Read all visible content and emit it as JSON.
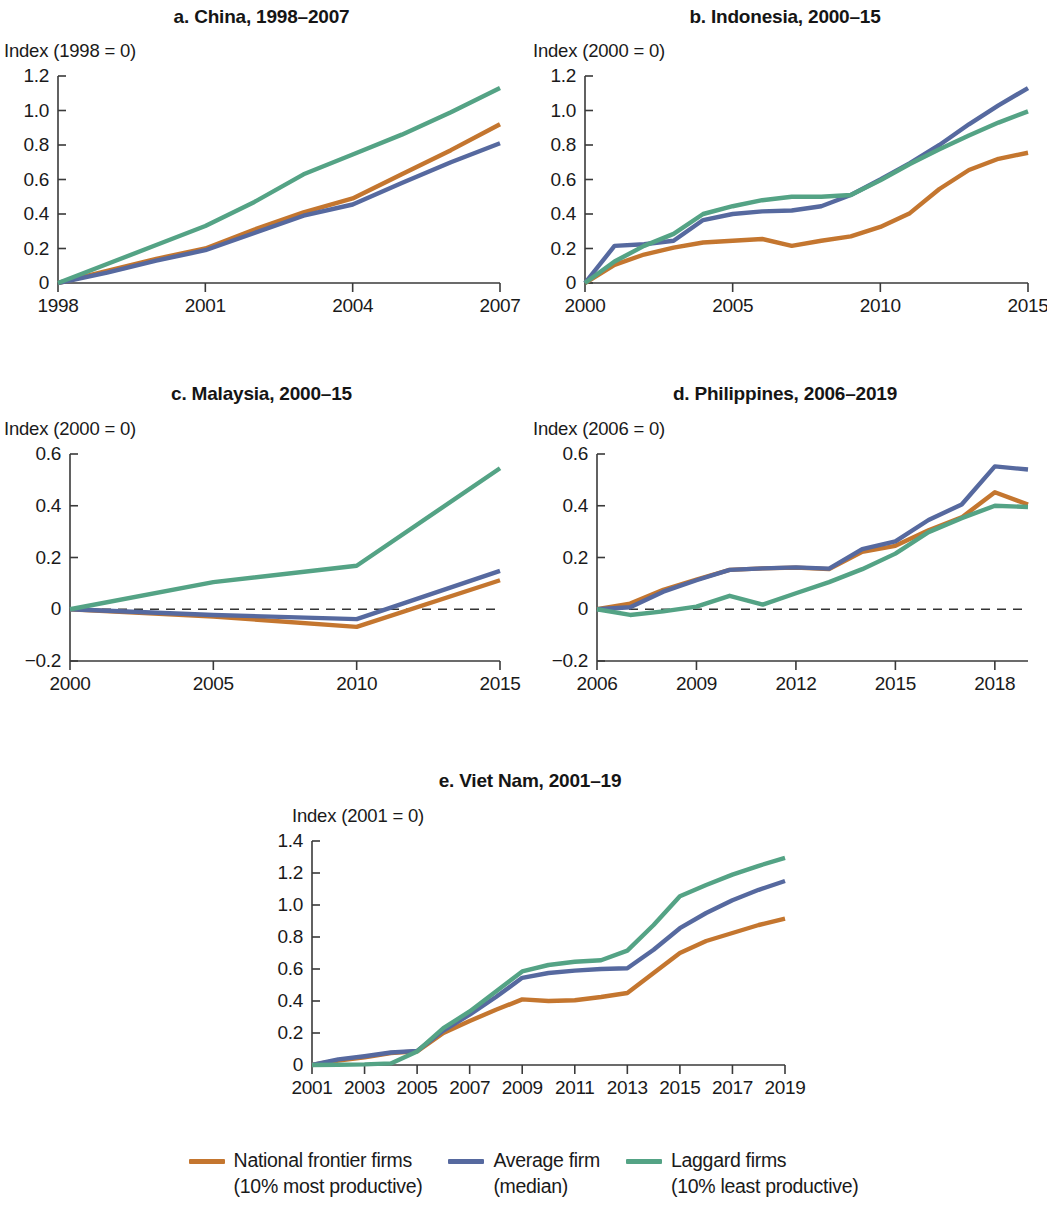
{
  "figure": {
    "background": "#ffffff",
    "colors": {
      "frontier": "#c4762f",
      "average": "#56699f",
      "laggard": "#54a385"
    }
  },
  "legend": {
    "items": [
      {
        "key": "frontier",
        "color": "#c4762f",
        "line1": "National frontier firms",
        "line2": "(10% most productive)"
      },
      {
        "key": "average",
        "color": "#56699f",
        "line1": "Average firm",
        "line2": "(median)"
      },
      {
        "key": "laggard",
        "color": "#54a385",
        "line1": "Laggard firms",
        "line2": "(10% least productive)"
      }
    ]
  },
  "chart_data": [
    {
      "id": "china",
      "type": "line",
      "title": "a. China, 1998–2007",
      "ylabel": "Index (1998 = 0)",
      "xlabel": "",
      "grid": false,
      "zeroline": false,
      "legend_position": "bottom",
      "xlim": [
        1998,
        2007
      ],
      "ylim": [
        0,
        1.2
      ],
      "yticks": [
        0,
        0.2,
        0.4,
        0.6,
        0.8,
        1.0,
        1.2
      ],
      "yticklabels": [
        "0",
        "0.2",
        "0.4",
        "0.6",
        "0.8",
        "1.0",
        "1.2"
      ],
      "xticks": [
        1998,
        2001,
        2004,
        2007
      ],
      "xticklabels": [
        "1998",
        "2001",
        "2004",
        "2007"
      ],
      "x": [
        1998,
        1999,
        2000,
        2001,
        2002,
        2003,
        2004,
        2005,
        2006,
        2007
      ],
      "series": [
        {
          "name": "National frontier firms",
          "key": "frontier",
          "color": "#c4762f",
          "values": [
            0,
            0.07,
            0.14,
            0.2,
            0.31,
            0.41,
            0.49,
            0.63,
            0.77,
            0.92
          ]
        },
        {
          "name": "Average firm",
          "key": "average",
          "color": "#56699f",
          "values": [
            0,
            0.06,
            0.13,
            0.19,
            0.29,
            0.39,
            0.455,
            0.58,
            0.7,
            0.81
          ]
        },
        {
          "name": "Laggard firms",
          "key": "laggard",
          "color": "#54a385",
          "values": [
            0,
            0.11,
            0.22,
            0.33,
            0.47,
            0.63,
            0.745,
            0.86,
            0.99,
            1.13
          ]
        }
      ]
    },
    {
      "id": "indonesia",
      "type": "line",
      "title": "b. Indonesia, 2000–15",
      "ylabel": "Index (2000 = 0)",
      "xlabel": "",
      "grid": false,
      "zeroline": false,
      "legend_position": "bottom",
      "xlim": [
        2000,
        2015
      ],
      "ylim": [
        0,
        1.2
      ],
      "yticks": [
        0,
        0.2,
        0.4,
        0.6,
        0.8,
        1.0,
        1.2
      ],
      "yticklabels": [
        "0",
        "0.2",
        "0.4",
        "0.6",
        "0.8",
        "1.0",
        "1.2"
      ],
      "xticks": [
        2000,
        2005,
        2010,
        2015
      ],
      "xticklabels": [
        "2000",
        "2005",
        "2010",
        "2015"
      ],
      "x": [
        2000,
        2001,
        2002,
        2003,
        2004,
        2005,
        2006,
        2007,
        2008,
        2009,
        2010,
        2011,
        2012,
        2013,
        2014,
        2015
      ],
      "series": [
        {
          "name": "National frontier firms",
          "key": "frontier",
          "color": "#c4762f",
          "values": [
            0,
            0.105,
            0.165,
            0.205,
            0.235,
            0.245,
            0.255,
            0.215,
            0.245,
            0.27,
            0.325,
            0.405,
            0.545,
            0.655,
            0.72,
            0.755
          ]
        },
        {
          "name": "Average firm",
          "key": "average",
          "color": "#56699f",
          "values": [
            0,
            0.215,
            0.225,
            0.245,
            0.365,
            0.4,
            0.415,
            0.42,
            0.445,
            0.51,
            0.6,
            0.695,
            0.8,
            0.92,
            1.03,
            1.13
          ]
        },
        {
          "name": "Laggard firms",
          "key": "laggard",
          "color": "#54a385",
          "values": [
            0,
            0.125,
            0.215,
            0.285,
            0.4,
            0.445,
            0.48,
            0.5,
            0.5,
            0.51,
            0.595,
            0.69,
            0.775,
            0.855,
            0.93,
            0.995
          ]
        }
      ]
    },
    {
      "id": "malaysia",
      "type": "line",
      "title": "c. Malaysia, 2000–15",
      "ylabel": "Index (2000 = 0)",
      "xlabel": "",
      "grid": false,
      "zeroline": true,
      "legend_position": "bottom",
      "xlim": [
        2000,
        2015
      ],
      "ylim": [
        -0.2,
        0.6
      ],
      "yticks": [
        -0.2,
        0,
        0.2,
        0.4,
        0.6
      ],
      "yticklabels": [
        "−0.2",
        "0",
        "0.2",
        "0.4",
        "0.6"
      ],
      "xticks": [
        2000,
        2005,
        2010,
        2015
      ],
      "xticklabels": [
        "2000",
        "2005",
        "2010",
        "2015"
      ],
      "x": [
        2000,
        2005,
        2010,
        2015
      ],
      "series": [
        {
          "name": "National frontier firms",
          "key": "frontier",
          "color": "#c4762f",
          "values": [
            0,
            -0.028,
            -0.068,
            0.112
          ]
        },
        {
          "name": "Average firm",
          "key": "average",
          "color": "#56699f",
          "values": [
            0,
            -0.022,
            -0.038,
            0.148
          ]
        },
        {
          "name": "Laggard firms",
          "key": "laggard",
          "color": "#54a385",
          "values": [
            0,
            0.105,
            0.168,
            0.545
          ]
        }
      ]
    },
    {
      "id": "philippines",
      "type": "line",
      "title": "d. Philippines, 2006–2019",
      "ylabel": "Index (2006 = 0)",
      "xlabel": "",
      "grid": false,
      "zeroline": true,
      "legend_position": "bottom",
      "xlim": [
        2006,
        2019
      ],
      "ylim": [
        -0.2,
        0.6
      ],
      "yticks": [
        -0.2,
        0,
        0.2,
        0.4,
        0.6
      ],
      "yticklabels": [
        "−0.2",
        "0",
        "0.2",
        "0.4",
        "0.6"
      ],
      "xticks": [
        2006,
        2009,
        2012,
        2015,
        2018
      ],
      "xticklabels": [
        "2006",
        "2009",
        "2012",
        "2015",
        "2018"
      ],
      "x": [
        2006,
        2007,
        2008,
        2009,
        2010,
        2011,
        2012,
        2013,
        2014,
        2015,
        2016,
        2017,
        2018,
        2019
      ],
      "series": [
        {
          "name": "National frontier firms",
          "key": "frontier",
          "color": "#c4762f",
          "values": [
            0,
            0.022,
            0.075,
            0.115,
            0.152,
            0.158,
            0.161,
            0.155,
            0.222,
            0.245,
            0.305,
            0.355,
            0.452,
            0.405
          ]
        },
        {
          "name": "Average firm",
          "key": "average",
          "color": "#56699f",
          "values": [
            0,
            0.008,
            0.068,
            0.112,
            0.152,
            0.158,
            0.162,
            0.157,
            0.232,
            0.262,
            0.345,
            0.405,
            0.552,
            0.54
          ]
        },
        {
          "name": "Laggard firms",
          "key": "laggard",
          "color": "#54a385",
          "values": [
            0,
            -0.022,
            -0.008,
            0.01,
            0.052,
            0.018,
            0.062,
            0.105,
            0.155,
            0.215,
            0.298,
            0.352,
            0.4,
            0.395
          ]
        }
      ]
    },
    {
      "id": "vietnam",
      "type": "line",
      "title": "e. Viet Nam, 2001–19",
      "ylabel": "Index (2001 = 0)",
      "xlabel": "",
      "grid": false,
      "zeroline": false,
      "legend_position": "bottom",
      "xlim": [
        2001,
        2019
      ],
      "ylim": [
        0,
        1.4
      ],
      "yticks": [
        0,
        0.2,
        0.4,
        0.6,
        0.8,
        1.0,
        1.2,
        1.4
      ],
      "yticklabels": [
        "0",
        "0.2",
        "0.4",
        "0.6",
        "0.8",
        "1.0",
        "1.2",
        "1.4"
      ],
      "xticks": [
        2001,
        2003,
        2005,
        2007,
        2009,
        2011,
        2013,
        2015,
        2017,
        2019
      ],
      "xticklabels": [
        "2001",
        "2003",
        "2005",
        "2007",
        "2009",
        "2011",
        "2013",
        "2015",
        "2017",
        "2019"
      ],
      "x": [
        2001,
        2002,
        2003,
        2004,
        2005,
        2006,
        2007,
        2008,
        2009,
        2010,
        2011,
        2012,
        2013,
        2014,
        2015,
        2016,
        2017,
        2018,
        2019
      ],
      "series": [
        {
          "name": "National frontier firms",
          "key": "frontier",
          "color": "#c4762f",
          "values": [
            0,
            0.028,
            0.048,
            0.075,
            0.085,
            0.2,
            0.275,
            0.345,
            0.41,
            0.4,
            0.405,
            0.425,
            0.45,
            0.575,
            0.7,
            0.775,
            0.825,
            0.875,
            0.915
          ]
        },
        {
          "name": "Average firm",
          "key": "average",
          "color": "#56699f",
          "values": [
            0,
            0.035,
            0.055,
            0.078,
            0.088,
            0.215,
            0.315,
            0.425,
            0.545,
            0.575,
            0.59,
            0.6,
            0.605,
            0.72,
            0.855,
            0.95,
            1.03,
            1.095,
            1.15
          ]
        },
        {
          "name": "Laggard firms",
          "key": "laggard",
          "color": "#54a385",
          "values": [
            0,
            0.002,
            0.004,
            0.01,
            0.085,
            0.23,
            0.335,
            0.46,
            0.585,
            0.625,
            0.645,
            0.655,
            0.715,
            0.875,
            1.055,
            1.125,
            1.19,
            1.245,
            1.295
          ]
        }
      ]
    }
  ]
}
